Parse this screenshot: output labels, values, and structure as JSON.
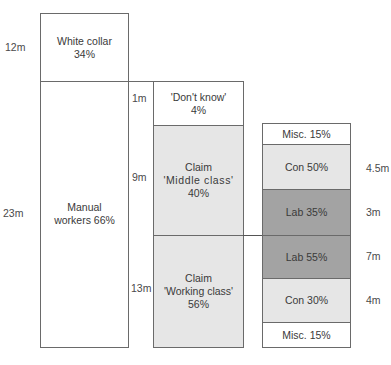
{
  "diagram": {
    "column1": {
      "segments": [
        {
          "count": "12m",
          "label_line1": "White collar",
          "label_line2": "34%"
        },
        {
          "count": "23m",
          "label_line1": "Manual",
          "label_line2": "workers 66%"
        }
      ]
    },
    "column2": {
      "segments": [
        {
          "count": "1m",
          "label_line1": "'Don't know'",
          "label_line2": "4%"
        },
        {
          "count": "9m",
          "label_line1": "Claim",
          "label_line2": "'Middle class'",
          "label_line3": "40%"
        },
        {
          "count": "13m",
          "label_line1": "Claim",
          "label_line2": "'Working class'",
          "label_line3": "56%"
        }
      ]
    },
    "column3": {
      "segments": [
        {
          "label": "Misc. 15%",
          "count": ""
        },
        {
          "label": "Con 50%",
          "count": "4.5m"
        },
        {
          "label": "Lab 35%",
          "count": "3m"
        },
        {
          "label": "Lab 55%",
          "count": "7m"
        },
        {
          "label": "Con 30%",
          "count": "4m"
        },
        {
          "label": "Misc. 15%",
          "count": ""
        }
      ]
    },
    "colors": {
      "white": "#ffffff",
      "light_grey": "#e6e6e6",
      "dark_grey": "#a3a3a3",
      "border": "#6a6a6a"
    }
  }
}
